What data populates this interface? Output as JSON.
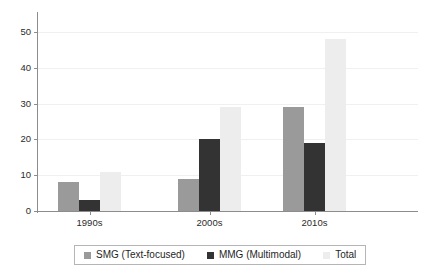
{
  "chart_data": {
    "type": "bar",
    "title": "",
    "subtitle": "",
    "xlabel": "",
    "ylabel": "",
    "categories": [
      "1990s",
      "2000s",
      "2010s"
    ],
    "series": [
      {
        "name": "SMG (Text-focused)",
        "values": [
          8,
          9,
          29
        ],
        "color": "#9a9a9a"
      },
      {
        "name": "MMG (Multimodal)",
        "values": [
          3,
          20,
          19
        ],
        "color": "#333333"
      },
      {
        "name": "Total",
        "values": [
          11,
          29,
          48
        ],
        "color": "#ededed"
      }
    ],
    "ylim": [
      0,
      55
    ],
    "yticks": [
      0,
      10,
      20,
      30,
      40,
      50
    ],
    "ytick_labels": [
      "0",
      "10",
      "20",
      "30",
      "40",
      "50"
    ],
    "grid": true,
    "grid_axis": "y",
    "legend_position": "bottom",
    "legend_boxed": true,
    "bar_grouping": "grouped"
  },
  "axis": {
    "y_ticks": [
      {
        "label": "50",
        "value": 50
      },
      {
        "label": "40",
        "value": 40
      },
      {
        "label": "30",
        "value": 30
      },
      {
        "label": "20",
        "value": 20
      },
      {
        "label": "10",
        "value": 10
      },
      {
        "label": "0",
        "value": 0
      }
    ],
    "x_ticks": [
      {
        "label": "1990s"
      },
      {
        "label": "2000s"
      },
      {
        "label": "2010s"
      }
    ]
  },
  "legend": {
    "items": [
      {
        "label": "SMG (Text-focused)",
        "swatch": "smg"
      },
      {
        "label": "MMG (Multimodal)",
        "swatch": "mmg"
      },
      {
        "label": "Total",
        "swatch": "total"
      }
    ]
  }
}
